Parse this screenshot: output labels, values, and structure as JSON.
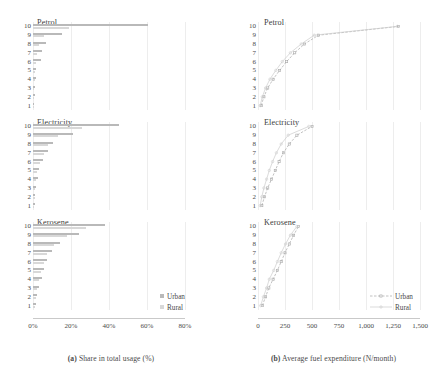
{
  "panels": {
    "a": {
      "caption_tag": "(a)",
      "caption_text": "Share in total usage (%)",
      "xticks": [
        "0%",
        "20%",
        "40%",
        "60%",
        "80%"
      ],
      "xlim": [
        0,
        80
      ],
      "ylabel_values": [
        "10",
        "9",
        "8",
        "7",
        "6",
        "5",
        "4",
        "3",
        "2",
        "1"
      ],
      "legend": [
        {
          "label": "Urban",
          "color": "#b9b9b9"
        },
        {
          "label": "Rural",
          "color": "#d8d8d8"
        }
      ]
    },
    "b": {
      "caption_tag": "(b)",
      "caption_text": "Average fuel expenditure (N/month)",
      "xticks": [
        "0",
        "250",
        "500",
        "750",
        "1,000",
        "1,250",
        "1,500"
      ],
      "xlim": [
        0,
        1500
      ],
      "ylabel_values": [
        "10",
        "9",
        "8",
        "7",
        "6",
        "5",
        "4",
        "3",
        "2",
        "1"
      ],
      "legend": [
        {
          "label": "Urban",
          "color": "#a8a8a8"
        },
        {
          "label": "Rural",
          "color": "#cccccc"
        }
      ]
    }
  },
  "subpanels": [
    {
      "title": "Petrol"
    },
    {
      "title": "Electricity"
    },
    {
      "title": "Kerosene"
    }
  ],
  "chart_data": [
    {
      "type": "bar",
      "title": "Petrol",
      "panel": "a",
      "orientation": "horizontal",
      "xlabel": "Share in total usage (%)",
      "ylabel": "Income decile",
      "xlim": [
        0,
        80
      ],
      "grid": true,
      "categories": [
        "10",
        "9",
        "8",
        "7",
        "6",
        "5",
        "4",
        "3",
        "2",
        "1"
      ],
      "series": [
        {
          "name": "Urban",
          "values": [
            60.5,
            15.0,
            7.0,
            4.5,
            4.2,
            1.6,
            1.4,
            0.9,
            0.8,
            0.7
          ]
        },
        {
          "name": "Rural",
          "values": [
            19.0,
            5.5,
            3.0,
            2.2,
            1.8,
            1.0,
            0.8,
            0.6,
            0.5,
            0.4
          ]
        }
      ]
    },
    {
      "type": "bar",
      "title": "Electricity",
      "panel": "a",
      "orientation": "horizontal",
      "xlabel": "Share in total usage (%)",
      "ylabel": "Income decile",
      "xlim": [
        0,
        80
      ],
      "grid": true,
      "categories": [
        "10",
        "9",
        "8",
        "7",
        "6",
        "5",
        "4",
        "3",
        "2",
        "1"
      ],
      "series": [
        {
          "name": "Urban",
          "values": [
            45.0,
            21.0,
            10.5,
            8.0,
            5.0,
            3.0,
            2.4,
            1.6,
            1.2,
            0.9
          ]
        },
        {
          "name": "Rural",
          "values": [
            26.0,
            13.0,
            8.0,
            5.5,
            3.5,
            2.2,
            1.6,
            1.1,
            0.9,
            0.6
          ]
        }
      ]
    },
    {
      "type": "bar",
      "title": "Kerosene",
      "panel": "a",
      "orientation": "horizontal",
      "xlabel": "Share in total usage (%)",
      "ylabel": "Income decile",
      "xlim": [
        0,
        80
      ],
      "grid": true,
      "categories": [
        "10",
        "9",
        "8",
        "7",
        "6",
        "5",
        "4",
        "3",
        "2",
        "1"
      ],
      "series": [
        {
          "name": "Urban",
          "values": [
            38.0,
            24.0,
            14.0,
            10.0,
            7.5,
            6.0,
            4.5,
            3.0,
            2.2,
            1.8
          ]
        },
        {
          "name": "Rural",
          "values": [
            28.0,
            18.0,
            11.0,
            7.5,
            5.5,
            4.0,
            3.0,
            2.0,
            1.5,
            1.2
          ]
        }
      ]
    },
    {
      "type": "line",
      "title": "Petrol",
      "panel": "b",
      "xlabel": "Average fuel expenditure (N/month)",
      "ylabel": "Income decile",
      "xlim": [
        0,
        1500
      ],
      "grid": true,
      "categories": [
        "1",
        "2",
        "3",
        "4",
        "5",
        "6",
        "7",
        "8",
        "9",
        "10"
      ],
      "series": [
        {
          "name": "Urban",
          "values": [
            30,
            55,
            90,
            140,
            200,
            265,
            340,
            430,
            560,
            1300
          ]
        },
        {
          "name": "Rural",
          "values": [
            20,
            40,
            70,
            110,
            165,
            225,
            300,
            400,
            520,
            1290
          ]
        }
      ]
    },
    {
      "type": "line",
      "title": "Electricity",
      "panel": "b",
      "xlabel": "Average fuel expenditure (N/month)",
      "ylabel": "Income decile",
      "xlim": [
        0,
        1500
      ],
      "grid": true,
      "categories": [
        "1",
        "2",
        "3",
        "4",
        "5",
        "6",
        "7",
        "8",
        "9",
        "10"
      ],
      "series": [
        {
          "name": "Urban",
          "values": [
            35,
            60,
            90,
            125,
            160,
            195,
            235,
            290,
            360,
            500
          ]
        },
        {
          "name": "Rural",
          "values": [
            20,
            35,
            55,
            80,
            105,
            135,
            170,
            215,
            280,
            470
          ]
        }
      ]
    },
    {
      "type": "line",
      "title": "Kerosene",
      "panel": "b",
      "xlabel": "Average fuel expenditure (N/month)",
      "ylabel": "Income decile",
      "xlim": [
        0,
        1500
      ],
      "grid": true,
      "categories": [
        "1",
        "2",
        "3",
        "4",
        "5",
        "6",
        "7",
        "8",
        "9",
        "10"
      ],
      "series": [
        {
          "name": "Urban",
          "values": [
            40,
            70,
            100,
            140,
            180,
            215,
            250,
            290,
            330,
            375
          ]
        },
        {
          "name": "Rural",
          "values": [
            25,
            50,
            80,
            105,
            145,
            180,
            215,
            255,
            300,
            360
          ]
        }
      ]
    }
  ]
}
